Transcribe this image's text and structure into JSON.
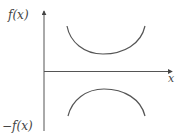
{
  "diagram": {
    "labels": {
      "y_top": "f(x)",
      "y_bottom": "−f(x)",
      "x_axis": "x"
    },
    "colors": {
      "axis": "#555555",
      "curve": "#555555",
      "text": "#444444",
      "background": "#ffffff"
    },
    "curves": [
      {
        "name": "f(x)",
        "shape": "concave-up",
        "description": "U-shaped curve above x-axis"
      },
      {
        "name": "-f(x)",
        "shape": "concave-down",
        "description": "Inverted U-shaped curve below x-axis (reflection of f(x))"
      }
    ]
  }
}
